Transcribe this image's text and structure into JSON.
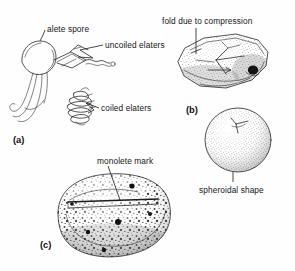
{
  "figure": {
    "background_color": "#fefefe",
    "ink_color": "#1b1b1b",
    "panels": [
      {
        "id": "a",
        "label": "(a)",
        "subject": "alete spore with elaters",
        "annotations": [
          {
            "name": "alete-spore",
            "text": "alete spore"
          },
          {
            "name": "uncoiled-elaters",
            "text": "uncoiled elaters"
          },
          {
            "name": "coiled-elaters",
            "text": "coiled elaters"
          }
        ]
      },
      {
        "id": "b",
        "label": "(b)",
        "subject": "compressed folded spore and spheroidal spore",
        "annotations": [
          {
            "name": "fold-due-to-compression",
            "text": "fold due to compression"
          },
          {
            "name": "spheroidal-shape",
            "text": "spheroidal shape"
          }
        ]
      },
      {
        "id": "c",
        "label": "(c)",
        "subject": "bean shaped spore with monolete mark",
        "annotations": [
          {
            "name": "monolete-mark",
            "text": "monolete mark"
          }
        ]
      }
    ]
  },
  "labels": {
    "alete_spore": "alete spore",
    "uncoiled_elaters": "uncoiled elaters",
    "coiled_elaters": "coiled elaters",
    "fold_due_to_compression": "fold due to compression",
    "spheroidal_shape": "spheroidal shape",
    "monolete_mark": "monolete mark",
    "panel_a": "(a)",
    "panel_b": "(b)",
    "panel_c": "(c)"
  }
}
